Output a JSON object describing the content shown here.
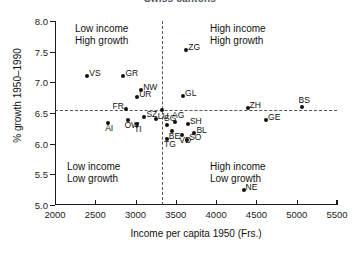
{
  "chart_data": {
    "type": "scatter",
    "title": "Swiss cantons",
    "xlabel": "Income per capita 1950 (Frs.)",
    "ylabel": "% growth 1950–1990",
    "xlim": [
      2000,
      5500
    ],
    "ylim": [
      5.0,
      8.0
    ],
    "xticks": [
      2000,
      2500,
      3000,
      3500,
      4000,
      4500,
      5000,
      5500
    ],
    "yticks": [
      "8.0",
      "7.5",
      "7.0",
      "6.5",
      "6.0",
      "5.5",
      "5.0"
    ],
    "xtick_labels": [
      "2000",
      "2500",
      "3000",
      "3500",
      "4000",
      "4500",
      "5000",
      "5500"
    ],
    "grid": false,
    "legend": "none",
    "reference_lines": {
      "x": 3330,
      "y": 6.55,
      "style": "dashed"
    },
    "annotations": [
      {
        "id": "quadrant-top-left",
        "line1": "Low income",
        "line2": "High growth"
      },
      {
        "id": "quadrant-top-right",
        "line1": "High income",
        "line2": "High growth"
      },
      {
        "id": "quadrant-bottom-left",
        "line1": "Low income",
        "line2": "Low growth"
      },
      {
        "id": "quadrant-bottom-right",
        "line1": "High income",
        "line2": "Low growth"
      }
    ],
    "points": [
      {
        "label": "VS",
        "x": 2400,
        "y": 7.1,
        "pos": "r"
      },
      {
        "label": "GR",
        "x": 2850,
        "y": 7.1,
        "pos": "r"
      },
      {
        "label": "NW",
        "x": 3070,
        "y": 6.88,
        "pos": "r"
      },
      {
        "label": "UR",
        "x": 3020,
        "y": 6.76,
        "pos": "r"
      },
      {
        "label": "ZG",
        "x": 3630,
        "y": 7.52,
        "pos": "r"
      },
      {
        "label": "GL",
        "x": 3590,
        "y": 6.78,
        "pos": "r"
      },
      {
        "label": "FR",
        "x": 2880,
        "y": 6.56,
        "pos": "l"
      },
      {
        "label": "ZH",
        "x": 4390,
        "y": 6.58,
        "pos": "r"
      },
      {
        "label": "BS",
        "x": 5060,
        "y": 6.6,
        "pos": "t"
      },
      {
        "label": "SZ",
        "x": 3110,
        "y": 6.44,
        "pos": "r"
      },
      {
        "label": "LU",
        "x": 3250,
        "y": 6.4,
        "pos": "r"
      },
      {
        "label": "AI",
        "x": 2660,
        "y": 6.34,
        "pos": "b"
      },
      {
        "label": "OW",
        "x": 2900,
        "y": 6.38,
        "pos": "b"
      },
      {
        "label": "TI",
        "x": 3020,
        "y": 6.32,
        "pos": "b"
      },
      {
        "label": "SG",
        "x": 3390,
        "y": 6.3,
        "pos": "t"
      },
      {
        "label": "AG",
        "x": 3490,
        "y": 6.36,
        "pos": "t"
      },
      {
        "label": "SH",
        "x": 3650,
        "y": 6.32,
        "pos": "r"
      },
      {
        "label": "GE",
        "x": 4620,
        "y": 6.38,
        "pos": "r"
      },
      {
        "label": "BE",
        "x": 3450,
        "y": 6.2,
        "pos": "b"
      },
      {
        "label": "VD",
        "x": 3580,
        "y": 6.14,
        "pos": "b"
      },
      {
        "label": "BL",
        "x": 3730,
        "y": 6.18,
        "pos": "r"
      },
      {
        "label": "TG",
        "x": 3390,
        "y": 6.08,
        "pos": "b"
      },
      {
        "label": "SO",
        "x": 3640,
        "y": 6.06,
        "pos": "r"
      },
      {
        "label": "NE",
        "x": 4340,
        "y": 5.25,
        "pos": "r"
      },
      {
        "label": "",
        "x": 3330,
        "y": 6.55,
        "pos": "r"
      }
    ]
  }
}
